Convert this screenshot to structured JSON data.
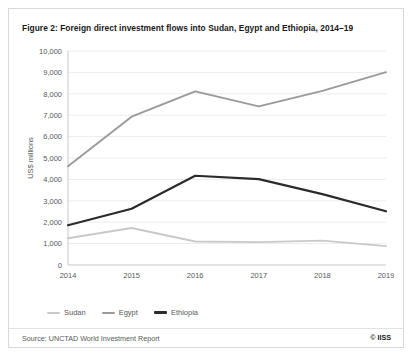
{
  "figure": {
    "title": "Figure 2: Foreign direct investment flows into Sudan, Egypt and Ethiopia, 2014–19",
    "source": "Source: UNCTAD World Investment Report",
    "credit": "© IISS"
  },
  "legend": {
    "position": "bottom-left",
    "entries": [
      {
        "label": "Sudan",
        "color": "#c9c9c9"
      },
      {
        "label": "Egypt",
        "color": "#9a9a9a"
      },
      {
        "label": "Ethiopia",
        "color": "#2b2b2b"
      }
    ]
  },
  "chart_data": {
    "type": "line",
    "title": "Figure 2: Foreign direct investment flows into Sudan, Egypt and Ethiopia, 2014–19",
    "xlabel": "",
    "ylabel": "US$ millions",
    "categories": [
      "2014",
      "2015",
      "2016",
      "2017",
      "2018",
      "2019"
    ],
    "x": [
      2014,
      2015,
      2016,
      2017,
      2018,
      2019
    ],
    "ylim": [
      0,
      10000
    ],
    "yticks": [
      0,
      1000,
      2000,
      3000,
      4000,
      5000,
      6000,
      7000,
      8000,
      9000,
      10000
    ],
    "ytick_labels": [
      "0",
      "1,000",
      "2,000",
      "3,000",
      "4,000",
      "5,000",
      "6,000",
      "7,000",
      "8,000",
      "9,000",
      "10,000"
    ],
    "grid": true,
    "legend_position": "bottom-left",
    "series": [
      {
        "name": "Sudan",
        "color": "#c9c9c9",
        "values": [
          1250,
          1730,
          1100,
          1070,
          1140,
          880
        ]
      },
      {
        "name": "Egypt",
        "color": "#9a9a9a",
        "values": [
          4610,
          6930,
          8110,
          7410,
          8140,
          9010
        ]
      },
      {
        "name": "Ethiopia",
        "color": "#2b2b2b",
        "values": [
          1860,
          2630,
          4170,
          4010,
          3310,
          2510
        ]
      }
    ]
  }
}
